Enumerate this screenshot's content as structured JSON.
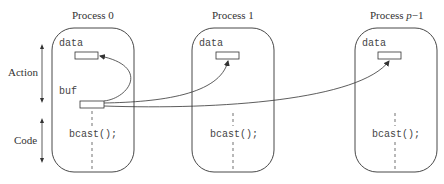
{
  "side_labels": {
    "action": "Action",
    "code": "Code"
  },
  "processes": [
    {
      "title": "Process 0",
      "data_label": "data",
      "buf_label": "buf",
      "call": "bcast();"
    },
    {
      "title": "Process 1",
      "data_label": "data",
      "call": "bcast();"
    },
    {
      "title_prefix": "Process ",
      "title_var": "p",
      "title_suffix": "−1",
      "data_label": "data",
      "call": "bcast();"
    }
  ],
  "colors": {
    "stroke": "#333333",
    "text": "#333333"
  }
}
